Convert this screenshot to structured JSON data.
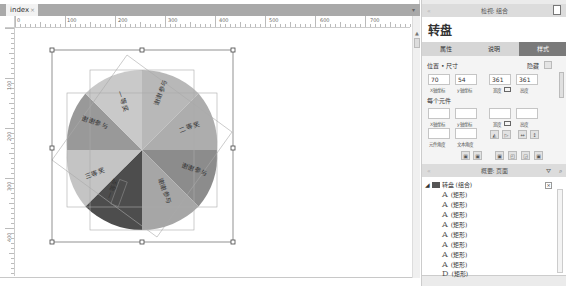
{
  "document_tab": {
    "label": "index",
    "close": "×"
  },
  "ruler": {
    "horizontal": [
      "0",
      "100",
      "200",
      "300",
      "400",
      "500",
      "600",
      "700"
    ],
    "vertical": [
      "100",
      "200",
      "300",
      "400"
    ]
  },
  "canvas": {
    "widget_name": "转盘",
    "pie_segments": [
      {
        "label": "谢谢参与",
        "color": "#b8b8b8"
      },
      {
        "label": "二等奖",
        "color": "#adadad"
      },
      {
        "label": "谢谢参与",
        "color": "#8c8c8c"
      },
      {
        "label": "谢谢参与",
        "color": "#a6a6a6"
      },
      {
        "label": "一等奖",
        "color": "#4d4d4d"
      },
      {
        "label": "三等奖",
        "color": "#c4c4c4"
      },
      {
        "label": "谢谢参与",
        "color": "#999999"
      },
      {
        "label": "一等奖",
        "color": "#c9c9c9"
      }
    ]
  },
  "inspector": {
    "header": "检视: 组合",
    "title": "转盘",
    "tabs": [
      {
        "label": "属性",
        "active": false
      },
      {
        "label": "说明",
        "active": false
      },
      {
        "label": "样式",
        "active": true
      }
    ],
    "position_size_label": "位置 • 尺寸",
    "hidden_label": "隐藏",
    "x_value": "70",
    "y_value": "54",
    "w_value": "361",
    "h_value": "361",
    "x_caption": "X轴坐标",
    "y_caption": "y轴坐标",
    "w_caption": "宽度",
    "h_caption": "高度",
    "each_element_label": "每个元件",
    "each": {
      "x_caption": "X轴坐标",
      "y_caption": "y轴坐标",
      "w_caption": "宽度",
      "h_caption": "高度",
      "rotate_caption": "元件角度",
      "text_rotate_caption": "文本角度"
    }
  },
  "outline": {
    "header": "概要: 页面",
    "root": "转盘 (组合)",
    "items": [
      "(矩形)",
      "(矩形)",
      "(矩形)",
      "(矩形)",
      "(矩形)",
      "(矩形)",
      "(矩形)",
      "(矩形)",
      "(矩形)"
    ],
    "item_glyphs": [
      "A",
      "A",
      "A",
      "A",
      "A",
      "A",
      "A",
      "A",
      "D"
    ]
  }
}
